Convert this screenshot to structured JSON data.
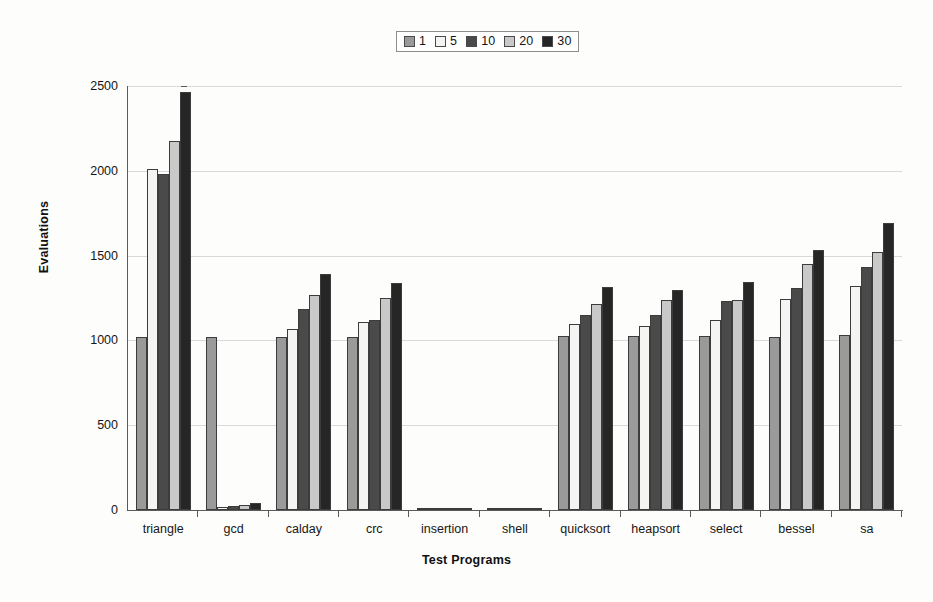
{
  "chart_data": {
    "type": "bar",
    "title": "",
    "xlabel": "Test Programs",
    "ylabel": "Evaluations",
    "ylim": [
      0,
      2500
    ],
    "yticks": [
      0,
      500,
      1000,
      1500,
      2000,
      2500
    ],
    "ytick_labels": [
      "0",
      "500",
      "1000",
      "1500",
      "2000",
      "2500"
    ],
    "grid": true,
    "legend_position": "top-center",
    "legend_title": "",
    "categories": [
      "triangle",
      "gcd",
      "calday",
      "crc",
      "insertion",
      "shell",
      "quicksort",
      "heapsort",
      "select",
      "bessel",
      "sa"
    ],
    "series": [
      {
        "name": "1",
        "color": "#9a9a9a",
        "values": [
          1020,
          1020,
          1020,
          1020,
          8,
          8,
          1025,
          1025,
          1025,
          1020,
          1030
        ]
      },
      {
        "name": "5",
        "color": "#f4f4f2",
        "values": [
          2010,
          18,
          1070,
          1110,
          8,
          10,
          1095,
          1085,
          1120,
          1245,
          1320
        ]
      },
      {
        "name": "10",
        "color": "#4a4a4a",
        "values": [
          1980,
          22,
          1185,
          1120,
          10,
          12,
          1150,
          1150,
          1230,
          1310,
          1430
        ]
      },
      {
        "name": "20",
        "color": "#c9c9c9",
        "values": [
          2175,
          28,
          1270,
          1250,
          12,
          12,
          1215,
          1240,
          1240,
          1450,
          1520
        ]
      },
      {
        "name": "30",
        "color": "#262626",
        "values": [
          2465,
          40,
          1390,
          1340,
          14,
          14,
          1315,
          1300,
          1345,
          1535,
          1690
        ]
      }
    ]
  }
}
